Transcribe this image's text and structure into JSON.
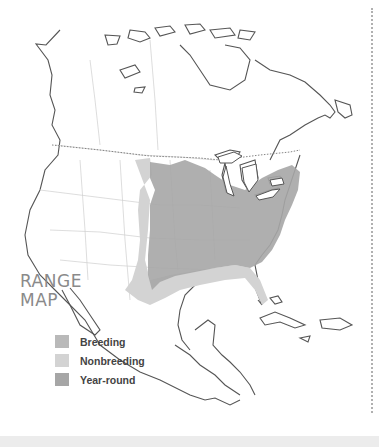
{
  "title": {
    "line1": "RANGE",
    "line2": "MAP"
  },
  "legend": [
    {
      "label": "Breeding",
      "color": "#b9b9b9"
    },
    {
      "label": "Nonbreeding",
      "color": "#d3d3d3"
    },
    {
      "label": "Year-round",
      "color": "#a6a6a6"
    }
  ],
  "colors": {
    "coastline": "#555555",
    "border": "#cccccc",
    "year_round": "#a6a6a6",
    "nonbreeding": "#d3d3d3",
    "background": "#ffffff"
  }
}
